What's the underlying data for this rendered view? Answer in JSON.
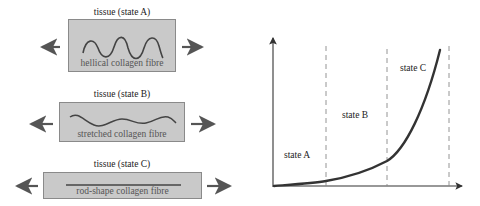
{
  "left_panel": {
    "states": [
      {
        "title": "tissue (state A)",
        "fibre_label": "hellical collagen fibre",
        "fibre_shape": "helical"
      },
      {
        "title": "tissue (state B)",
        "fibre_label": "stretched collagen fibre",
        "fibre_shape": "stretched-wave"
      },
      {
        "title": "tissue (state C)",
        "fibre_label": "rod-shape collagen fibre",
        "fibre_shape": "straight-rod"
      }
    ],
    "arrows": "tension-arrows-both-sides"
  },
  "graph": {
    "regions": [
      {
        "label": "state A"
      },
      {
        "label": "state B"
      },
      {
        "label": "state C"
      }
    ],
    "curve": "exponential",
    "x_axis_label": "",
    "y_axis_label": ""
  },
  "colors": {
    "box_fill": "#c9c9c9",
    "box_border": "#8a8a8a",
    "arrow": "#555555",
    "curve": "#333333",
    "fibre": "#444444",
    "dashed": "#888888"
  }
}
